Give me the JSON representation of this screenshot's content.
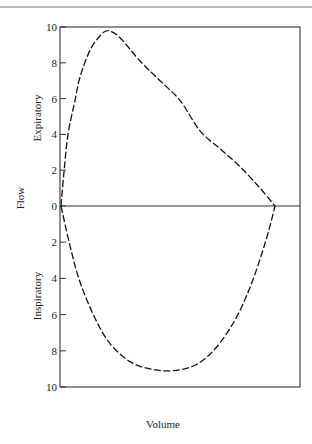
{
  "chart_data": {
    "type": "line",
    "title": "",
    "xlabel": "Volume",
    "ylabel": "Flow",
    "upper_label": "Expiratory",
    "lower_label": "Inspiratory",
    "yticks_upper": [
      "10",
      "8",
      "6",
      "4",
      "2",
      "0"
    ],
    "yticks_lower": [
      "2",
      "4",
      "6",
      "8",
      "10"
    ],
    "ylim": [
      -10,
      10
    ],
    "grid": false,
    "legend": null,
    "series": [
      {
        "name": "Expiratory flow",
        "line_style": "dashed",
        "x_px": [
          61,
          64,
          68,
          75,
          80,
          90,
          100,
          108,
          120,
          140,
          160,
          180,
          200,
          220,
          240,
          260,
          275
        ],
        "y": [
          0,
          1.9,
          4.0,
          5.9,
          7.2,
          8.7,
          9.5,
          9.8,
          9.4,
          8.1,
          7.0,
          5.9,
          4.2,
          3.2,
          2.2,
          1.0,
          0
        ]
      },
      {
        "name": "Inspiratory flow",
        "line_style": "dashed",
        "x_px": [
          61,
          70,
          80,
          95,
          110,
          130,
          150,
          172,
          195,
          215,
          235,
          250,
          262,
          270,
          275
        ],
        "y": [
          0,
          -2.2,
          -4.2,
          -6.2,
          -7.6,
          -8.6,
          -9.0,
          -9.1,
          -8.8,
          -7.9,
          -6.3,
          -4.5,
          -2.6,
          -1.1,
          0
        ]
      }
    ]
  },
  "labels": {
    "xlabel": "Volume",
    "ylabel": "Flow",
    "upper": "Expiratory",
    "lower": "Inspiratory"
  }
}
